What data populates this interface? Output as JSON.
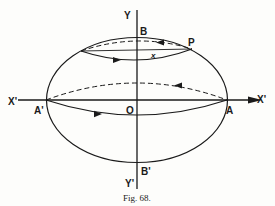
{
  "figure": {
    "caption": "Fig. 68.",
    "ink_color": "#1a1a1a",
    "background": "#fdfdfb",
    "labels": {
      "y_top": "Y",
      "y_bottom": "Y'",
      "x_left": "X'",
      "x_right": "X'",
      "b_top": "B",
      "b_bottom": "B'",
      "a_left": "A'",
      "a_right": "A",
      "origin": "O",
      "point_p": "P",
      "x_var": "x"
    }
  }
}
